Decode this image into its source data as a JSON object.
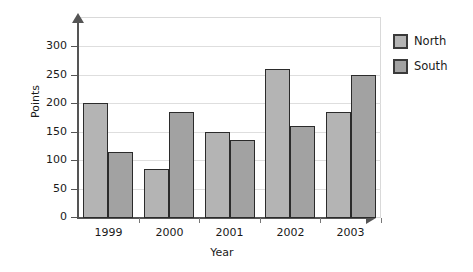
{
  "chart_data": {
    "type": "bar",
    "title": "",
    "subtitle": "",
    "xlabel": "Year",
    "ylabel": "Points",
    "categories": [
      "1999",
      "2000",
      "2001",
      "2002",
      "2003"
    ],
    "series": [
      {
        "name": "North",
        "color": "#b4b4b4",
        "values": [
          200,
          85,
          150,
          260,
          185
        ]
      },
      {
        "name": "South",
        "color": "#a2a2a2",
        "values": [
          115,
          185,
          135,
          160,
          250
        ]
      }
    ],
    "ylim": [
      0,
      350
    ],
    "yticks": [
      0,
      50,
      100,
      150,
      200,
      250,
      300
    ],
    "ytick_labels": [
      "0",
      "50",
      "100",
      "150",
      "200",
      "250",
      "300"
    ],
    "grid": true,
    "grid_axis": "y",
    "legend_position": "right",
    "axis_arrows": true,
    "bar_border_color": "#2b2b2b",
    "frame_color": "#d9d9d9",
    "background": "#ffffff"
  },
  "legend": {
    "entries": [
      {
        "label": "North",
        "swatch": "legend-swatch-north"
      },
      {
        "label": "South",
        "swatch": "legend-swatch-south"
      }
    ]
  }
}
